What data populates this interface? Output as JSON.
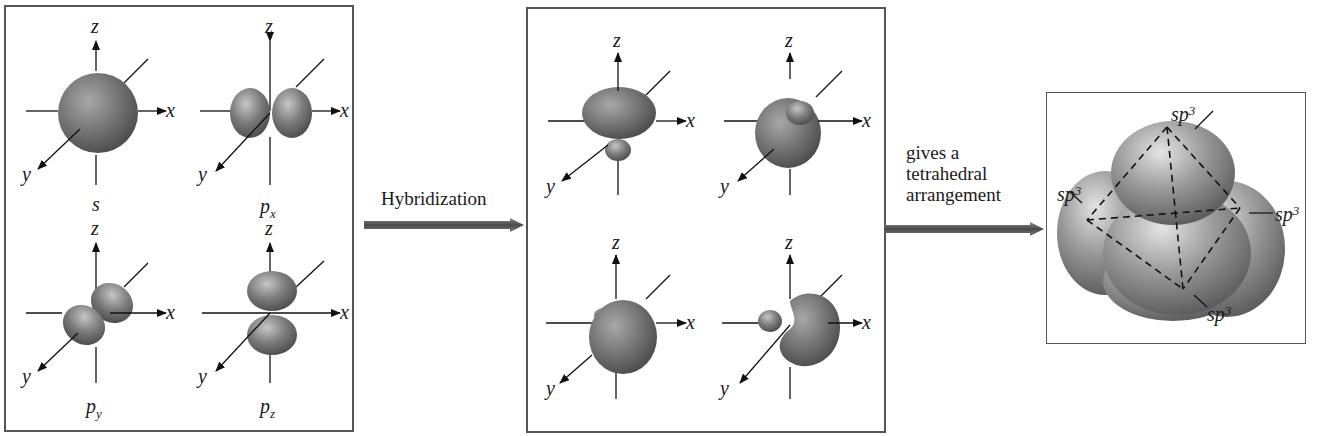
{
  "figure": {
    "panel_atomic_orbitals": {
      "orbitals": [
        {
          "label": "s",
          "subscript": "",
          "axes": {
            "x": "x",
            "y": "y",
            "z": "z"
          }
        },
        {
          "label": "p",
          "subscript": "x",
          "axes": {
            "x": "x",
            "y": "y",
            "z": "z"
          }
        },
        {
          "label": "p",
          "subscript": "y",
          "axes": {
            "x": "x",
            "y": "y",
            "z": "z"
          }
        },
        {
          "label": "p",
          "subscript": "z",
          "axes": {
            "x": "x",
            "y": "y",
            "z": "z"
          }
        }
      ]
    },
    "arrow1": {
      "label": "Hybridization"
    },
    "panel_hybrid_orbitals": {
      "orbitals": [
        {
          "axes": {
            "x": "x",
            "y": "y",
            "z": "z"
          }
        },
        {
          "axes": {
            "x": "x",
            "y": "y",
            "z": "z"
          }
        },
        {
          "axes": {
            "x": "x",
            "y": "y",
            "z": "z"
          }
        },
        {
          "axes": {
            "x": "x",
            "y": "y",
            "z": "z"
          }
        }
      ]
    },
    "arrow2": {
      "label_lines": [
        "gives a",
        "tetrahedral",
        "arrangement"
      ]
    },
    "panel_tetrahedral": {
      "lobe_labels": [
        {
          "base": "sp",
          "exp": "3",
          "position": "top"
        },
        {
          "base": "sp",
          "exp": "3",
          "position": "left"
        },
        {
          "base": "sp",
          "exp": "3",
          "position": "right"
        },
        {
          "base": "sp",
          "exp": "3",
          "position": "bottom"
        }
      ]
    },
    "colors": {
      "orbital_fill": "#6f6f6f",
      "orbital_highlight": "#c8c8c8",
      "orbital_shadow": "#3e3e3e",
      "arrow": "#5a5a5a",
      "border": "#555555",
      "axis": "#111111"
    }
  }
}
